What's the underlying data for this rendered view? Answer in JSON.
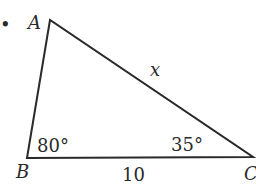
{
  "diagram": {
    "type": "triangle",
    "bullet": "•",
    "vertices": {
      "A": {
        "label": "A",
        "x": 50,
        "y": 20
      },
      "B": {
        "label": "B",
        "x": 27,
        "y": 158
      },
      "C": {
        "label": "C",
        "x": 253,
        "y": 157
      }
    },
    "angles": {
      "B": "80°",
      "C": "35°"
    },
    "sides": {
      "AC": "x",
      "BC": "10"
    },
    "colors": {
      "line": "#2a2a2a",
      "text": "#2a2a2a",
      "background": "#ffffff"
    }
  }
}
